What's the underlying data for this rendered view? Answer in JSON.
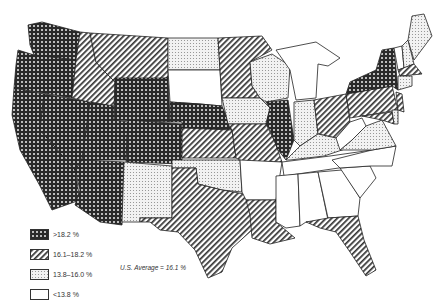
{
  "map": {
    "subject": "United States choropleth by state (percentage categories)",
    "average_label": "U.S. Average = 16.1 %",
    "colors": {
      "stroke": "#222222",
      "background": "#ffffff"
    },
    "legend": [
      {
        "id": "high",
        "label": ">18.2 %",
        "pattern": "crosshatch-dark"
      },
      {
        "id": "midhigh",
        "label": "16.1–18.2 %",
        "pattern": "diagonal-lines"
      },
      {
        "id": "midlow",
        "label": "13.8–16.0 %",
        "pattern": "light-dots"
      },
      {
        "id": "low",
        "label": "<13.8 %",
        "pattern": "blank"
      }
    ],
    "states": {
      "WA": "high",
      "OR": "high",
      "CA": "high",
      "NV": "high",
      "ID": "midhigh",
      "MT": "midhigh",
      "WY": "high",
      "UT": "high",
      "CO": "high",
      "AZ": "high",
      "NM": "midlow",
      "ND": "midlow",
      "SD": "low",
      "NE": "high",
      "KS": "midhigh",
      "OK": "midlow",
      "TX": "midhigh",
      "MN": "midhigh",
      "IA": "midlow",
      "MO": "midhigh",
      "AR": "low",
      "LA": "midhigh",
      "WI": "midlow",
      "IL": "high",
      "MI": "low",
      "IN": "midlow",
      "OH": "midhigh",
      "KY": "midlow",
      "TN": "low",
      "MS": "low",
      "AL": "low",
      "GA": "low",
      "FL": "midhigh",
      "SC": "low",
      "NC": "low",
      "VA": "midlow",
      "WV": "low",
      "PA": "midhigh",
      "NY": "high",
      "VT": "low",
      "NH": "midlow",
      "ME": "midlow",
      "MA": "midhigh",
      "CT": "midlow",
      "NJ": "midhigh",
      "MD": "midhigh",
      "DE": "midlow"
    }
  }
}
